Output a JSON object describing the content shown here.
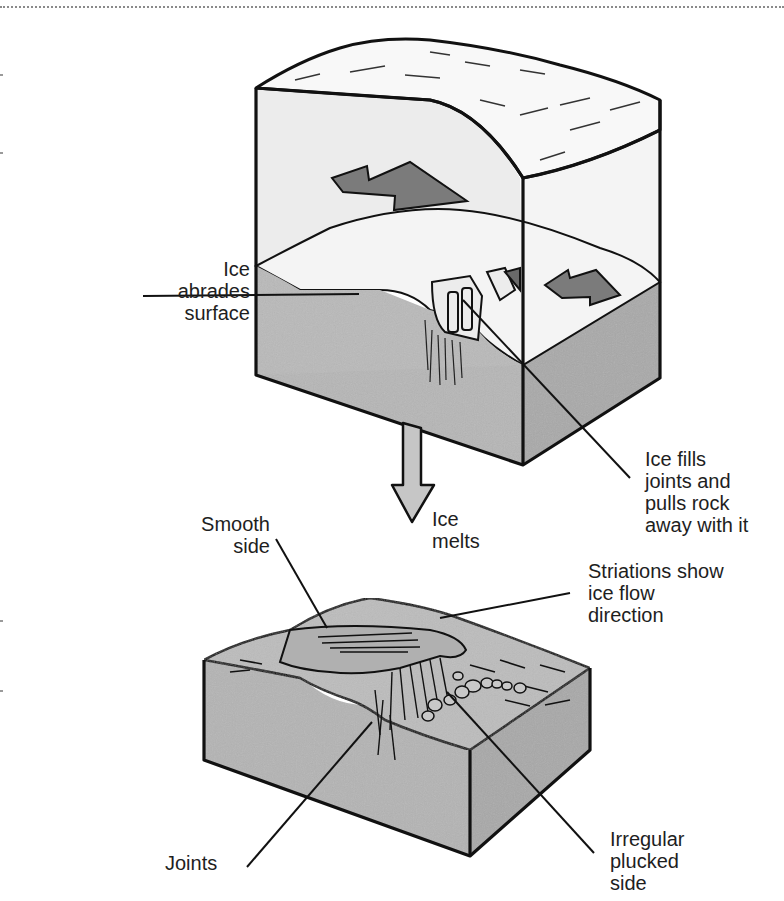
{
  "figure": {
    "stages": [
      {
        "name": "during-glaciation",
        "description": "Ice block over bedrock with flow arrows"
      },
      {
        "name": "after-melting",
        "description": "Roche moutonnée bedrock surface"
      }
    ],
    "transition_label": "Ice\nmelts",
    "colors": {
      "ice": "#f2f2f2",
      "ice_face": "#e6e6e6",
      "rock": "#b4b4b4",
      "rock_dark": "#a4a4a4",
      "arrow_fill": "#7a7a7a",
      "down_arrow_fill": "#c6c6c6",
      "outline": "#111111"
    }
  },
  "labels": {
    "ice_abrades": "Ice\nabrades\nsurface",
    "ice_fills": "Ice fills\njoints and\npulls rock\naway with it",
    "ice_melts": "Ice\nmelts",
    "smooth_side": "Smooth\nside",
    "striations": "Striations show\nice flow\ndirection",
    "joints": "Joints",
    "plucked_side": "Irregular\nplucked\nside"
  }
}
